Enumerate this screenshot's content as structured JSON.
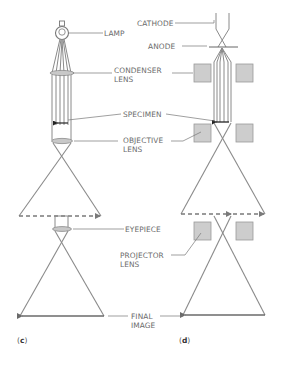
{
  "diagram": {
    "type": "comparison",
    "colors": {
      "stroke": "#7a7a7a",
      "ray": "#8a8a8a",
      "lens_fill": "#c8c8c8",
      "magnet_fill": "#cdcdcd",
      "arrow": "#333333",
      "label": "#6a6a6a"
    },
    "panels": [
      {
        "id": "c",
        "tag_open": "(",
        "tag_letter": "c",
        "tag_close": ")",
        "description": "Light microscope"
      },
      {
        "id": "d",
        "tag_open": "(",
        "tag_letter": "d",
        "tag_close": ")",
        "description": "Electron microscope"
      }
    ],
    "labels": {
      "lamp": "LAMP",
      "cathode": "CATHODE",
      "anode": "ANODE",
      "condenser_line1": "CONDENSER",
      "condenser_line2": "LENS",
      "specimen": "SPECIMEN",
      "objective_line1": "OBJECTIVE",
      "objective_line2": "LENS",
      "eyepiece": "EYEPIECE",
      "projector_line1": "PROJECTOR",
      "projector_line2": "LENS",
      "final_line1": "FINAL",
      "final_line2": "IMAGE"
    }
  }
}
